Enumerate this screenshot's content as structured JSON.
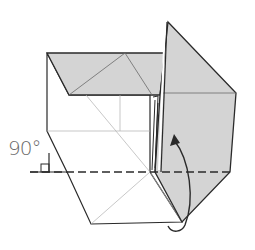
{
  "diagram": {
    "type": "origami-fold-step",
    "angle_label": "90°",
    "colors": {
      "paper_colored": "#d4d4d4",
      "paper_white": "#ffffff",
      "edge": "#2a2a2a",
      "crease": "#9a9a9a"
    },
    "annotations": {
      "fold_arrow": "curved arrow indicating flap rotates up 90°",
      "valley_fold_line": "dashed horizontal line",
      "right_angle_symbol": "square corner marker"
    }
  }
}
